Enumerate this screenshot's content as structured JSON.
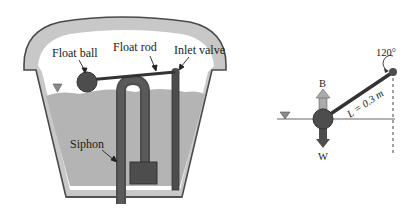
{
  "tank_diagram": {
    "labels": {
      "float_ball": "Float ball",
      "float_rod": "Float rod",
      "inlet_valve": "Inlet valve",
      "siphon": "Siphon"
    }
  },
  "free_body_diagram": {
    "angle_label": "120°",
    "length_label": "L = 0.3 m",
    "buoyancy_label": "B",
    "weight_label": "W"
  },
  "colors": {
    "tank_wall": "#c8c8c8",
    "tank_outline": "#4a4a4a",
    "water": "#b4b4b4",
    "dark_part": "#4d4d4d",
    "arrow_gray": "#aaaaaa"
  }
}
